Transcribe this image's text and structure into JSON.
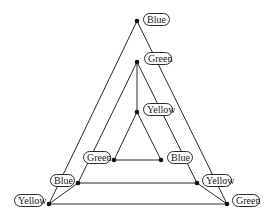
{
  "diagram": {
    "colors": {
      "line": "#2a2a2a",
      "node": "#111111",
      "label_border": "#2a2a2a",
      "background": "#ffffff"
    },
    "nodes": [
      {
        "id": "outer_top",
        "label": "Blue",
        "x": 137,
        "y": 21,
        "label_x": 143,
        "label_y": 13,
        "label_w": 27
      },
      {
        "id": "mid_top",
        "label": "Green",
        "x": 137,
        "y": 62,
        "label_x": 144,
        "label_y": 52,
        "label_w": 28
      },
      {
        "id": "inner_top",
        "label": "Yellow",
        "x": 137,
        "y": 112,
        "label_x": 143,
        "label_y": 103,
        "label_w": 30
      },
      {
        "id": "inner_left",
        "label": "Green",
        "x": 114,
        "y": 160,
        "label_x": 83,
        "label_y": 151,
        "label_w": 28
      },
      {
        "id": "inner_right",
        "label": "Blue",
        "x": 161,
        "y": 160,
        "label_x": 167,
        "label_y": 151,
        "label_w": 26
      },
      {
        "id": "mid_left",
        "label": "Blue",
        "x": 78,
        "y": 183,
        "label_x": 50,
        "label_y": 174,
        "label_w": 25
      },
      {
        "id": "mid_right",
        "label": "Yellow",
        "x": 197,
        "y": 183,
        "label_x": 202,
        "label_y": 174,
        "label_w": 30
      },
      {
        "id": "outer_left",
        "label": "Yellow",
        "x": 49,
        "y": 204,
        "label_x": 14,
        "label_y": 194,
        "label_w": 30
      },
      {
        "id": "outer_right",
        "label": "Green",
        "x": 227,
        "y": 204,
        "label_x": 232,
        "label_y": 194,
        "label_w": 28
      }
    ],
    "edges": [
      [
        "outer_top",
        "outer_left"
      ],
      [
        "outer_top",
        "outer_right"
      ],
      [
        "outer_left",
        "outer_right"
      ],
      [
        "outer_left",
        "mid_left"
      ],
      [
        "outer_right",
        "mid_right"
      ],
      [
        "mid_top",
        "mid_left"
      ],
      [
        "mid_top",
        "mid_right"
      ],
      [
        "mid_left",
        "mid_right"
      ],
      [
        "mid_top",
        "inner_top"
      ],
      [
        "inner_top",
        "inner_left"
      ],
      [
        "inner_top",
        "inner_right"
      ],
      [
        "inner_left",
        "inner_right"
      ]
    ]
  }
}
